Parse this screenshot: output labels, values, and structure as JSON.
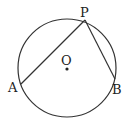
{
  "diagram": {
    "type": "circle-geometry",
    "circle": {
      "cx": 67,
      "cy": 68,
      "r": 49,
      "center_label": "O"
    },
    "points": [
      {
        "label": "P",
        "x": 85,
        "y": 20,
        "label_x": 80,
        "label_y": 17
      },
      {
        "label": "A",
        "x": 21,
        "y": 84,
        "label_x": 8,
        "label_y": 91
      },
      {
        "label": "B",
        "x": 115,
        "y": 79,
        "label_x": 112,
        "label_y": 94
      }
    ],
    "segments": [
      {
        "from": "P",
        "to": "A"
      },
      {
        "from": "P",
        "to": "B"
      }
    ],
    "colors": {
      "stroke": "#333333",
      "text": "#222222"
    }
  }
}
